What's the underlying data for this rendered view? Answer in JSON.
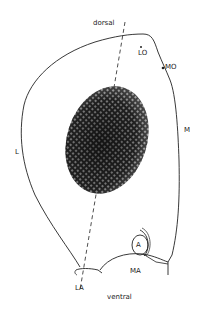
{
  "diagram": {
    "type": "anatomical-outline",
    "labels": {
      "dorsal": "dorsal",
      "ventral": "ventral",
      "LO": "LO",
      "MO": "MO",
      "M": "M",
      "L": "L",
      "A": "A",
      "MA": "MA",
      "LA": "LA"
    },
    "colors": {
      "line": "#222222",
      "eye_dark": "#1a1a1a",
      "background": "#ffffff"
    }
  }
}
